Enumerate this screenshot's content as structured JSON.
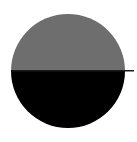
{
  "figure": {
    "canvas": {
      "width": 137,
      "height": 142,
      "background_color": "#ffffff"
    },
    "disc": {
      "center_x": 68,
      "center_y": 71,
      "radius": 57,
      "upper_half": {
        "label": "upper-half-gray",
        "color": "#6e6e6e",
        "fraction": "50%"
      },
      "lower_half": {
        "label": "lower-half-black",
        "color": "#000000",
        "fraction": "50%"
      }
    },
    "divider_line": {
      "label": "horizontal-diameter-axis",
      "color": "#1a1a1a",
      "thickness": 1.6,
      "y": 70,
      "x_start": 12,
      "x_end": 134,
      "overhang_right": 10
    }
  },
  "chart_data": {
    "type": "pie",
    "categories": [
      "upper-half-gray",
      "lower-half-black"
    ],
    "values": [
      50,
      50
    ],
    "colors": [
      "#6e6e6e",
      "#000000"
    ],
    "legend": "none",
    "grid": false,
    "annotations": [
      "horizontal diameter line extends beyond right edge of disc"
    ]
  }
}
